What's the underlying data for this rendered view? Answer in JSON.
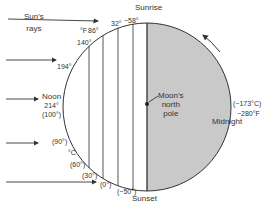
{
  "diagram": {
    "title_labels": {
      "sun_rays": [
        "Sun's",
        "rays"
      ],
      "sunrise": "Sunrise",
      "sunset": "Sunset",
      "noon": "Noon",
      "midnight": "Midnight",
      "pole": [
        "Moon's",
        "north",
        "pole"
      ]
    },
    "units": {
      "fahrenheit": "°F",
      "celsius": "°C"
    },
    "fahrenheit_labels": [
      "140°",
      "86°",
      "32°",
      "−58°",
      "194°"
    ],
    "noon_temp": {
      "f": "214°",
      "c": "(100°)"
    },
    "celsius_labels": [
      "(90°)",
      "(60°)",
      "(30°)",
      "(0°)",
      "(−50°)"
    ],
    "midnight_temp": {
      "c": "(−173°C)",
      "f": "−280°F"
    },
    "colors": {
      "night": "#c8c8c8",
      "line": "#333333",
      "day": "#ffffff"
    }
  }
}
